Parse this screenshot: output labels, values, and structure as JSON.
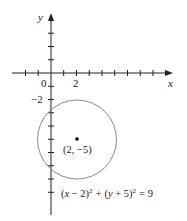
{
  "figure": {
    "type": "circle-graph",
    "axes": {
      "x_label": "x",
      "y_label": "y",
      "origin_label": "0",
      "x_tick_label": "2",
      "y_tick_label": "−2",
      "x_ticks": [
        -2,
        -1,
        1,
        2,
        3,
        4,
        5,
        6,
        7,
        8
      ],
      "y_ticks": [
        3,
        2,
        1,
        -1,
        -2,
        -3,
        -4,
        -5,
        -6,
        -7,
        -8,
        -9
      ]
    },
    "circle": {
      "center": [
        2,
        -5
      ],
      "radius": 3,
      "color": "#8a8a8a"
    },
    "center_label": "(2, −5)",
    "equation": {
      "lhs_a": "(x − 2)",
      "lhs_b": "(y + 5)",
      "exponent": "2",
      "plus": "+",
      "equals": "= 9",
      "full_text": "(x − 2)² + (y + 5)² = 9"
    },
    "colors": {
      "axis": "#222222",
      "circle": "#8a8a8a",
      "point": "#000000"
    }
  }
}
